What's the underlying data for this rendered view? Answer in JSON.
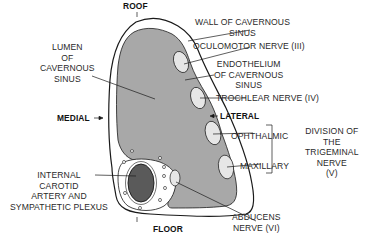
{
  "diagram": {
    "colors": {
      "wall_outline": "#1a1a1a",
      "lumen_fill": "#a8a8a8",
      "wall_fill": "#ffffff",
      "artery_fill": "#5a5a5a",
      "nerve_fill": "#e6e6e6",
      "text": "#2a2a2a"
    },
    "orientation": {
      "roof": "ROOF",
      "floor": "FLOOR",
      "medial": "MEDIAL",
      "lateral": "LATERAL"
    },
    "labels": {
      "lumen": [
        "LUMEN",
        "OF",
        "CAVERNOUS",
        "SINUS"
      ],
      "wall": [
        "WALL OF CAVERNOUS",
        "SINUS"
      ],
      "oculomotor": "OCULOMOTOR NERVE (III)",
      "endothelium": [
        "ENDOTHELIUM",
        "OF CAVERNOUS",
        "SINUS"
      ],
      "trochlear": "TROCHLEAR NERVE (IV)",
      "ophthalmic": "OPHTHALMIC",
      "maxillary": "MAXILLARY",
      "trigeminal_division": [
        "DIVISION OF",
        "THE",
        "TRIGEMINAL",
        "NERVE",
        "(V)"
      ],
      "carotid": [
        "INTERNAL",
        "CAROTID",
        "ARTERY AND",
        "SYMPATHETIC PLEXUS"
      ],
      "abducens": [
        "ABDUCENS",
        "NERVE (VI)"
      ]
    }
  }
}
